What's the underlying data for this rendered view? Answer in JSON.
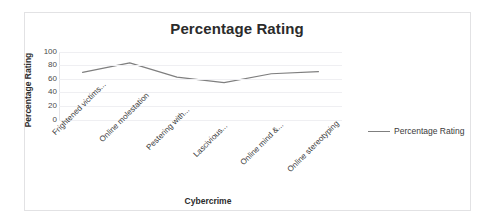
{
  "document": {
    "top_cropped_text": ""
  },
  "chart": {
    "title": "Percentage Rating",
    "x_axis_title": "Cybercrime",
    "y_axis_title": "Percentage Rating",
    "legend": {
      "position": "right",
      "entries": [
        {
          "label": "Percentage Rating",
          "color": "#7f7f7f"
        }
      ]
    },
    "colors": {
      "series_line": "#7f7f7f",
      "gridline": "#efeff2",
      "frame_border": "#e2e2e4",
      "text": "#2b2b2b"
    }
  },
  "chart_data": {
    "type": "line",
    "title": "Percentage Rating",
    "xlabel": "Cybercrime",
    "ylabel": "Percentage Rating",
    "categories": [
      "Frightened victims...",
      "Online molestation",
      "Pestering with...",
      "Lascivious...",
      "Online mind &...",
      "Online stereotyping"
    ],
    "series": [
      {
        "name": "Percentage Rating",
        "color": "#7f7f7f",
        "values": [
          70,
          84,
          63,
          55,
          68,
          71
        ]
      }
    ],
    "values": [
      70,
      84,
      63,
      55,
      68,
      71
    ],
    "ylim": [
      0,
      100
    ],
    "yticks": [
      100,
      80,
      60,
      40,
      20,
      0
    ],
    "ytick_labels": [
      "100",
      "80",
      "60",
      "40",
      "20",
      "0"
    ],
    "grid": true,
    "legend_position": "right",
    "markers": false
  }
}
